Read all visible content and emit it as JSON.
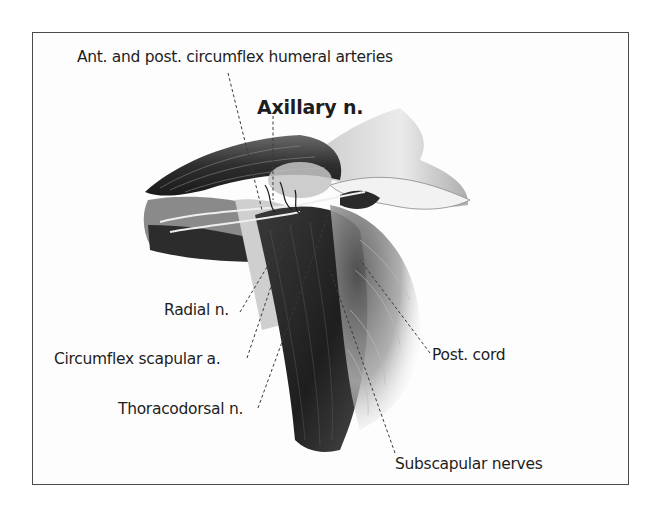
{
  "figure": {
    "title_label": "Axillary n.",
    "labels": {
      "humeral_arteries": "Ant. and post. circumflex humeral arteries",
      "axillary_nerve": "Axillary n.",
      "radial_nerve": "Radial n.",
      "circumflex_scapular": "Circumflex scapular a.",
      "thoracodorsal": "Thoracodorsal n.",
      "posterior_cord": "Post. cord",
      "subscapular": "Subscapular nerves"
    },
    "colors": {
      "frame": "#4a4a4a",
      "text": "#1e1e1e",
      "leader_line": "#3a3a3a",
      "illustration_dark": "#2a2a2a",
      "illustration_mid": "#7a7a7a",
      "illustration_light": "#d6d6d6"
    }
  }
}
